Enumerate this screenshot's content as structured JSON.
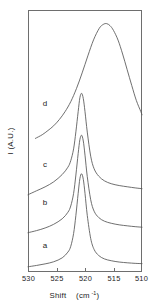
{
  "figure": {
    "title": "",
    "background_color": "#ffffff",
    "curve_color": "#555555",
    "axis_color": "#6e6e6e",
    "text_color": "#1c1c1c"
  },
  "axes": {
    "x_title_main": "Shift",
    "x_title_unit_base": "(cm",
    "x_title_unit_sup": "-1",
    "x_title_unit_close": ")",
    "y_title": "I (A.U.)",
    "x_tick_labels": [
      "530",
      "525",
      "520",
      "515",
      "510"
    ],
    "x_tick_values": [
      530,
      525,
      520,
      515,
      510
    ]
  },
  "curve_labels": [
    {
      "text": "a",
      "x_px": 45,
      "y_px": 248
    },
    {
      "text": "b",
      "x_px": 45,
      "y_px": 205
    },
    {
      "text": "c",
      "x_px": 45,
      "y_px": 167
    },
    {
      "text": "d",
      "x_px": 45,
      "y_px": 106
    }
  ],
  "chart_data": {
    "type": "line",
    "title": "",
    "subtitle": "",
    "xlabel": "Shift (cm-1)",
    "ylabel": "I (A.U.)",
    "xlim": [
      530,
      510
    ],
    "x_axis_reversed": true,
    "ylim": [
      0,
      1
    ],
    "y_ticks_shown": false,
    "grid": false,
    "legend_position": "inline-curve-labels",
    "x_tick_labels": [
      "530",
      "525",
      "520",
      "515",
      "510"
    ],
    "series": [
      {
        "name": "a",
        "label": "a",
        "peak_center_cm1": 520.6,
        "peak_fwhm_cm1": 4.0,
        "baseline_norm": 0.035,
        "amplitude_norm": 0.34,
        "x": [
          530.0,
          528.5,
          527.0,
          525.5,
          524.0,
          523.0,
          522.5,
          522.0,
          521.6,
          521.2,
          520.9,
          520.6,
          520.3,
          520.0,
          519.6,
          519.0,
          518.4,
          517.6,
          516.6,
          515.4,
          514.0,
          512.5,
          511.2,
          510.0
        ],
        "y": [
          0.02,
          0.025,
          0.031,
          0.039,
          0.054,
          0.076,
          0.098,
          0.147,
          0.216,
          0.3,
          0.356,
          0.375,
          0.354,
          0.3,
          0.216,
          0.128,
          0.086,
          0.063,
          0.05,
          0.043,
          0.038,
          0.035,
          0.033,
          0.032
        ]
      },
      {
        "name": "b",
        "label": "b",
        "peak_center_cm1": 520.6,
        "peak_fwhm_cm1": 4.4,
        "baseline_norm": 0.175,
        "amplitude_norm": 0.35,
        "x": [
          530.0,
          528.5,
          527.0,
          525.5,
          524.0,
          523.0,
          522.5,
          522.0,
          521.6,
          521.2,
          520.9,
          520.6,
          520.3,
          520.0,
          519.6,
          519.0,
          518.4,
          517.6,
          516.6,
          515.4,
          514.0,
          512.5,
          511.2,
          510.0
        ],
        "y": [
          0.15,
          0.158,
          0.168,
          0.182,
          0.203,
          0.228,
          0.252,
          0.3,
          0.37,
          0.452,
          0.505,
          0.522,
          0.5,
          0.446,
          0.364,
          0.276,
          0.232,
          0.208,
          0.194,
          0.186,
          0.18,
          0.176,
          0.173,
          0.171
        ]
      },
      {
        "name": "c",
        "label": "c",
        "peak_center_cm1": 520.6,
        "peak_fwhm_cm1": 5.0,
        "baseline_norm": 0.33,
        "amplitude_norm": 0.35,
        "x": [
          530.0,
          528.5,
          527.0,
          525.5,
          524.0,
          523.0,
          522.5,
          522.0,
          521.6,
          521.2,
          520.9,
          520.6,
          520.3,
          520.0,
          519.6,
          519.0,
          518.4,
          517.6,
          516.6,
          515.4,
          514.0,
          512.5,
          511.2,
          510.0
        ],
        "y": [
          0.295,
          0.31,
          0.325,
          0.344,
          0.372,
          0.4,
          0.425,
          0.47,
          0.535,
          0.612,
          0.665,
          0.682,
          0.662,
          0.612,
          0.534,
          0.442,
          0.394,
          0.366,
          0.348,
          0.337,
          0.33,
          0.325,
          0.321,
          0.318
        ]
      },
      {
        "name": "d",
        "label": "d",
        "peak_center_cm1": 516.0,
        "peak_fwhm_cm1": 9.0,
        "baseline_norm": 0.56,
        "amplitude_norm": 0.38,
        "x": [
          528.7,
          527.5,
          526.5,
          525.5,
          524.5,
          523.5,
          522.5,
          521.5,
          520.5,
          519.5,
          518.5,
          517.5,
          516.8,
          516.2,
          515.6,
          515.0,
          514.2,
          513.4,
          512.6,
          511.8,
          511.0,
          510.2,
          510.0
        ],
        "y": [
          0.51,
          0.524,
          0.54,
          0.558,
          0.582,
          0.612,
          0.65,
          0.7,
          0.76,
          0.825,
          0.886,
          0.93,
          0.945,
          0.948,
          0.94,
          0.922,
          0.885,
          0.832,
          0.772,
          0.712,
          0.655,
          0.612,
          0.6
        ]
      }
    ]
  },
  "plot_geometry": {
    "frame_left_px": 28,
    "frame_right_px": 142,
    "frame_top_px": 10,
    "frame_bottom_px": 272,
    "tick_length_px": 4
  }
}
